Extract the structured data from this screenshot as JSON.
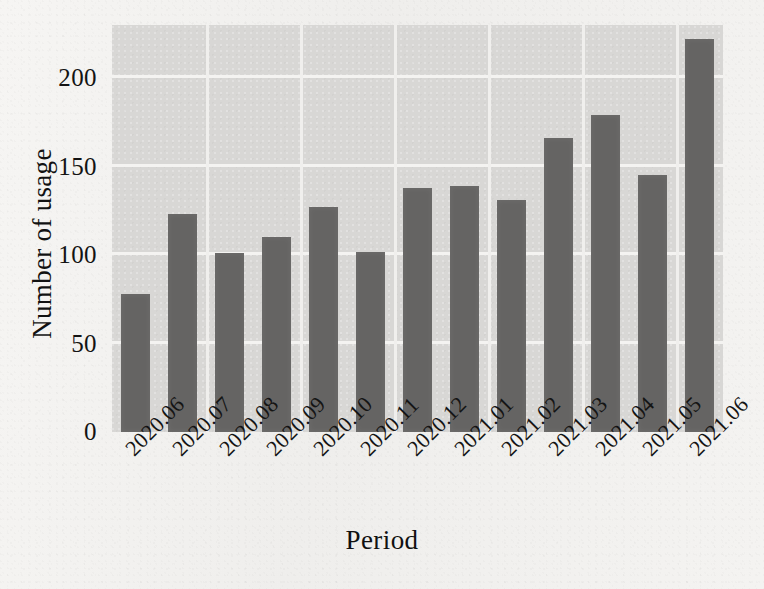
{
  "chart_data": {
    "type": "bar",
    "title": "",
    "xlabel": "Period",
    "ylabel": "Number of usage",
    "categories": [
      "2020.06",
      "2020.07",
      "2020.08",
      "2020.09",
      "2020.10",
      "2020.11",
      "2020.12",
      "2021.01",
      "2021.02",
      "2021.03",
      "2021.04",
      "2021.05",
      "2021.06"
    ],
    "values": [
      78,
      123,
      101,
      110,
      127,
      102,
      138,
      139,
      131,
      166,
      179,
      145,
      222
    ],
    "ylim": [
      0,
      230
    ],
    "yticks": [
      0,
      50,
      100,
      150,
      200
    ],
    "ytick_labels": [
      "0",
      "50",
      "100",
      "150",
      "200"
    ],
    "xtick_rotation": -45,
    "grid": "horizontal-and-vertical",
    "legend": "none",
    "series": [
      {
        "name": "Number of usage",
        "values": [
          78,
          123,
          101,
          110,
          127,
          102,
          138,
          139,
          131,
          166,
          179,
          145,
          222
        ]
      }
    ]
  },
  "style": {
    "bar_color": "#656463",
    "plot_background": "#d8d7d5",
    "grid_color": "#f4f3f1",
    "page_background": "#f3f2f0",
    "text_color": "#121212"
  }
}
